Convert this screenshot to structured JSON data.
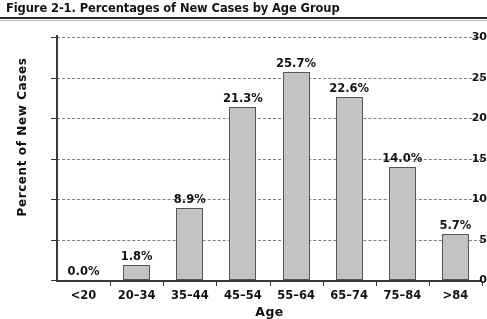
{
  "figure": {
    "title": "Figure 2-1. Percentages of New Cases by Age Group"
  },
  "chart_data": {
    "type": "bar",
    "title": "Figure 2-1. Percentages of New Cases by Age Group",
    "xlabel": "Age",
    "ylabel": "Percent of New Cases",
    "categories": [
      "<20",
      "20–34",
      "35–44",
      "45–54",
      "55–64",
      "65–74",
      "75–84",
      ">84"
    ],
    "values": [
      0.0,
      1.8,
      8.9,
      21.3,
      25.7,
      22.6,
      14.0,
      5.7
    ],
    "data_labels": [
      "0.0%",
      "1.8%",
      "8.9%",
      "21.3%",
      "25.7%",
      "22.6%",
      "14.0%",
      "5.7%"
    ],
    "ylim": [
      0,
      30
    ],
    "yticks": [
      0,
      5,
      10,
      15,
      20,
      25,
      30
    ],
    "ytick_labels": [
      "0",
      "5",
      "10",
      "15",
      "20",
      "25",
      "30"
    ],
    "grid": true,
    "grid_axis": "y",
    "grid_style": "dashed",
    "legend": null,
    "bar_fill_color": "#c2c2c2",
    "bar_edge_color": "#575757",
    "axis_color": "#3a3a3a",
    "background_color": "#ffffff"
  }
}
